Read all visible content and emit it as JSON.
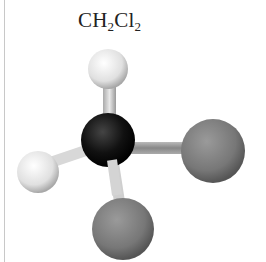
{
  "title": {
    "prefix": "CH",
    "sub1": "2",
    "mid": "Cl",
    "sub2": "2"
  },
  "molecule": {
    "name": "dichloromethane",
    "atoms": [
      {
        "element": "H",
        "label": "hydrogen-top"
      },
      {
        "element": "H",
        "label": "hydrogen-left"
      },
      {
        "element": "C",
        "label": "carbon-center"
      },
      {
        "element": "Cl",
        "label": "chlorine-right"
      },
      {
        "element": "Cl",
        "label": "chlorine-bottom"
      }
    ],
    "colors": {
      "hydrogen": "#e8e8e8",
      "carbon": "#111111",
      "chlorine": "#7a7a7a",
      "bond": "#d0d0d0"
    }
  }
}
